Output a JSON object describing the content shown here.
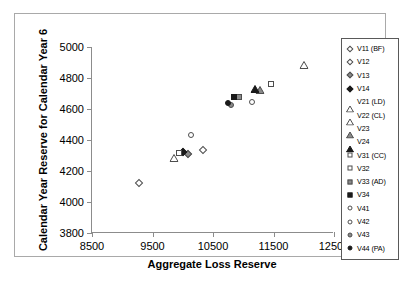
{
  "chart_data": {
    "type": "scatter",
    "title": "",
    "xlabel": "Aggregate Loss Reserve",
    "ylabel": "Calendar Year Reserve for Calendar Year 6",
    "xlim": [
      8500,
      12500
    ],
    "ylim": [
      3800,
      5000
    ],
    "xticks": [
      "8500",
      "9500",
      "10500",
      "11500",
      "12500"
    ],
    "yticks": [
      "3800",
      "4000",
      "4200",
      "4400",
      "4600",
      "4800",
      "5000"
    ],
    "grid": false,
    "legend_position": "right",
    "series": [
      {
        "name": "V11 (BF)",
        "marker": "diamond",
        "fill": "open",
        "x": 9280,
        "y": 4120
      },
      {
        "name": "V12",
        "marker": "diamond",
        "fill": "open",
        "x": 10330,
        "y": 4335
      },
      {
        "name": "V13",
        "marker": "diamond",
        "fill": "mid",
        "x": 10080,
        "y": 4308
      },
      {
        "name": "V14",
        "marker": "diamond",
        "fill": "solid",
        "x": 10000,
        "y": 4323
      },
      {
        "name": "V21 (LD)",
        "marker": "triangle",
        "fill": "open",
        "x": 12000,
        "y": 4920
      },
      {
        "name": "V22 (CL)",
        "marker": "triangle",
        "fill": "open",
        "x": 9850,
        "y": 4320
      },
      {
        "name": "V23",
        "marker": "triangle",
        "fill": "mid",
        "x": 11270,
        "y": 4763
      },
      {
        "name": "V24",
        "marker": "triangle",
        "fill": "solid",
        "x": 11190,
        "y": 4765
      },
      {
        "name": "V31 (CC)",
        "marker": "square",
        "fill": "open",
        "x": 9930,
        "y": 4315
      },
      {
        "name": "V32",
        "marker": "square",
        "fill": "open",
        "x": 11460,
        "y": 4763
      },
      {
        "name": "V33 (AD)",
        "marker": "square",
        "fill": "mid",
        "x": 10930,
        "y": 4678
      },
      {
        "name": "V34",
        "marker": "square",
        "fill": "solid",
        "x": 10855,
        "y": 4680
      },
      {
        "name": "V41",
        "marker": "circle",
        "fill": "open",
        "x": 11140,
        "y": 4648
      },
      {
        "name": "V42",
        "marker": "circle",
        "fill": "open",
        "x": 10130,
        "y": 4435
      },
      {
        "name": "V43",
        "marker": "circle",
        "fill": "mid",
        "x": 10790,
        "y": 4625
      },
      {
        "name": "V44 (PA)",
        "marker": "circle",
        "fill": "solid",
        "x": 10740,
        "y": 4640
      }
    ]
  },
  "legend": {
    "items": [
      "V11 (BF)",
      "V12",
      "V13",
      "V14",
      "V21 (LD)",
      "V22 (CL)",
      "V23",
      "V24",
      "V31 (CC)",
      "V32",
      "V33 (AD)",
      "V34",
      "V41",
      "V42",
      "V43",
      "V44 (PA)"
    ]
  },
  "colors": {
    "open": "#ffffff",
    "light": "#c8c8c8",
    "mid": "#8a8a8a",
    "solid": "#1a1a1a",
    "outline": "#4d4d4d",
    "axis": "#8c8c8c",
    "frame": "#a9a9a9"
  }
}
